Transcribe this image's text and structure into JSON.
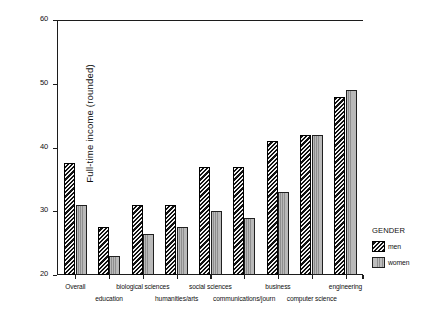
{
  "chart_data": {
    "type": "bar",
    "title": "",
    "subtitle": "",
    "xlabel": "",
    "ylabel": "Full-time income (rounded)",
    "ylim": [
      20,
      60
    ],
    "yticks": [
      20,
      30,
      40,
      50,
      60
    ],
    "grid": false,
    "legend_position": "right",
    "legend_title": "GENDER",
    "categories": [
      "Overall",
      "education",
      "biological sciences",
      "humanities/arts",
      "social sciences",
      "communications/journ",
      "business",
      "computer science",
      "engineering"
    ],
    "series": [
      {
        "name": "men",
        "values": [
          37.5,
          27.5,
          31.0,
          31.0,
          37.0,
          37.0,
          41.0,
          42.0,
          48.0
        ]
      },
      {
        "name": "women",
        "values": [
          31.0,
          23.0,
          26.5,
          27.5,
          30.0,
          29.0,
          33.0,
          42.0,
          49.0
        ]
      }
    ],
    "colors": {
      "men": "#111111",
      "women": "#b4b4b4",
      "axis": "#1c1c1c",
      "background": "#ffffff",
      "text": "#101010"
    },
    "patterns": {
      "men": "diagonal-hatch",
      "women": "vertical-stripe"
    }
  },
  "axes": {
    "y": {
      "label": "Full-time income (rounded)",
      "ticks": [
        {
          "value": 60,
          "text": "60"
        },
        {
          "value": 50,
          "text": "50"
        },
        {
          "value": 40,
          "text": "40"
        },
        {
          "value": 30,
          "text": "30"
        },
        {
          "value": 20,
          "text": "20"
        }
      ]
    },
    "x": {
      "ticks": [
        {
          "text": "Overall",
          "row": "a"
        },
        {
          "text": "education",
          "row": "b"
        },
        {
          "text": "biological sciences",
          "row": "a"
        },
        {
          "text": "humanities/arts",
          "row": "b"
        },
        {
          "text": "social sciences",
          "row": "a"
        },
        {
          "text": "communications/journ",
          "row": "b"
        },
        {
          "text": "business",
          "row": "a"
        },
        {
          "text": "computer science",
          "row": "b"
        },
        {
          "text": "engineering",
          "row": "a"
        }
      ]
    }
  },
  "legend": {
    "title": "GENDER",
    "items": [
      {
        "label": "men",
        "pattern": "diagonal-hatch"
      },
      {
        "label": "women",
        "pattern": "vertical-stripe"
      }
    ]
  }
}
